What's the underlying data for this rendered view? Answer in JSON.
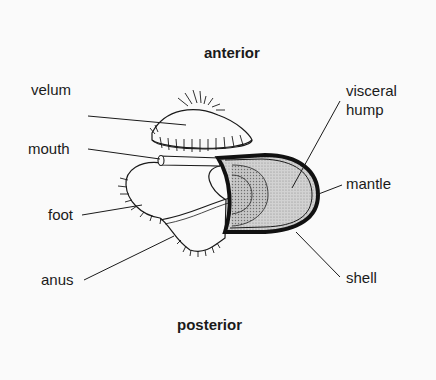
{
  "diagram": {
    "title_top": "anterior",
    "title_bottom": "posterior",
    "labels": {
      "velum": "velum",
      "mouth": "mouth",
      "foot": "foot",
      "anus": "anus",
      "visceral_hump_1": "visceral",
      "visceral_hump_2": "hump",
      "mantle": "mantle",
      "shell": "shell"
    }
  }
}
